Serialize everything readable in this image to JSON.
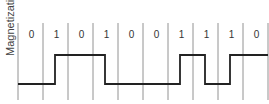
{
  "diagram": {
    "ylabel": "Magnetization",
    "bits": [
      "0",
      "1",
      "0",
      "1",
      "0",
      "0",
      "1",
      "1",
      "1",
      "0"
    ],
    "encoding": "transition at middle of each 1-bit cell",
    "initial_level": "low",
    "colors": {
      "wave": "#222222",
      "grid": "#777777",
      "text": "#333333"
    }
  }
}
